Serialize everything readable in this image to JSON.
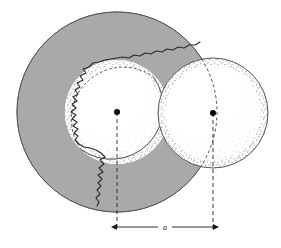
{
  "figure": {
    "kind": "geometry-diagram",
    "background_color": "#ffffff",
    "outline_color": "#4a4a4a",
    "stipple_color": "#8d8d8d",
    "shaded_region_color": "#a9a9a9",
    "dashed_color": "#2b2b2b",
    "center_dot_color": "#000000"
  },
  "dimension": {
    "label": "a",
    "label_x": 165,
    "label_y": 229,
    "line_y": 227,
    "start_x": 117,
    "end_x": 213,
    "arrowheads": "both",
    "extension_line_style": "dashed"
  },
  "shapes": {
    "large_sphere": {
      "name": "large-sphere",
      "cx": 117,
      "cy": 112,
      "r": 100,
      "stroke": "#555555",
      "fill": "#ffffff"
    },
    "inner_sphere": {
      "name": "inner-sphere",
      "cx": 117,
      "cy": 112,
      "r": 52,
      "stroke": "#4a4a4a",
      "fill": "#ffffff"
    },
    "right_sphere": {
      "name": "right-sphere",
      "cx": 213,
      "cy": 113,
      "r": 55,
      "stroke": "#555555",
      "fill": "#ffffff"
    }
  },
  "centers": [
    {
      "name": "left-center-dot",
      "cx": 117,
      "cy": 112,
      "r": 3
    },
    {
      "name": "right-center-dot",
      "cx": 213,
      "cy": 113,
      "r": 3
    }
  ],
  "center_lines": [
    {
      "name": "left-center-dashed-line",
      "x": 117,
      "y1": 112,
      "y2": 227
    },
    {
      "name": "right-center-dashed-line",
      "x": 213,
      "y1": 113,
      "y2": 227
    }
  ]
}
